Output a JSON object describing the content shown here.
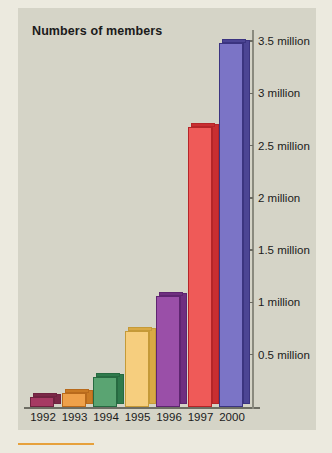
{
  "panel": {
    "background_color": "#d5d4c7",
    "page_background_color": "#eceadf",
    "accent_rule_color": "#e7a13c"
  },
  "chart_data": {
    "type": "bar",
    "title": "Numbers of members",
    "xlabel": "",
    "ylabel": "",
    "categories": [
      "1992",
      "1993",
      "1994",
      "1995",
      "1996",
      "1997",
      "2000"
    ],
    "values": [
      0.1,
      0.13,
      0.29,
      0.73,
      1.06,
      2.68,
      3.48
    ],
    "value_unit": "million",
    "ylim": [
      0,
      3.6
    ],
    "ytick_values": [
      0.5,
      1,
      1.5,
      2,
      2.5,
      3,
      3.5
    ],
    "ytick_labels": [
      "0.5 million",
      "1 million",
      "1.5 million",
      "2 million",
      "2.5 million",
      "3 million",
      "3.5 million"
    ],
    "grid": false,
    "legend": false,
    "axis_position": "right",
    "bar_colors": [
      "#a63a63",
      "#efa14a",
      "#5aa472",
      "#f6ce7e",
      "#9a4fa8",
      "#ef5a58",
      "#7b74c6"
    ],
    "bar_side_colors": [
      "#7a2847",
      "#c97a24",
      "#2f7a4c",
      "#d9a945",
      "#6f2f80",
      "#c92e31",
      "#4c4594"
    ],
    "bar_outline_colors": [
      "#6f2340",
      "#b86a1c",
      "#276a41",
      "#c59a38",
      "#5e2570",
      "#b52528",
      "#3b3480"
    ]
  },
  "axis": {
    "baseline_color": "#6d6d63",
    "vertical_color": "#8a8a7e"
  }
}
